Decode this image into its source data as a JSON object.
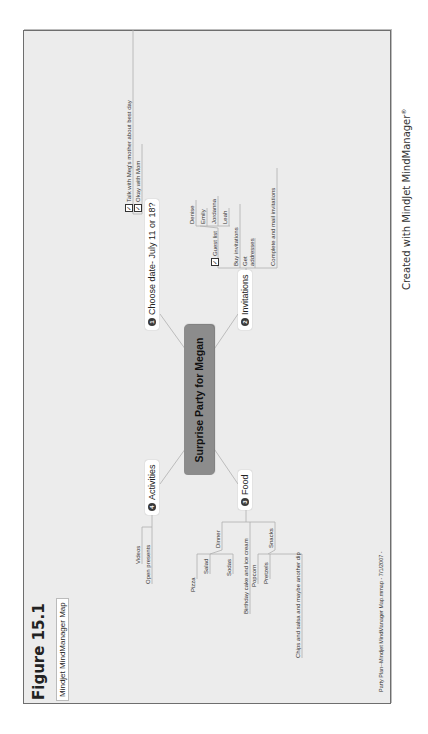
{
  "figure_title": "Figure 15.1",
  "map_label": "Mindjet MindManager Map",
  "central_topic": "Surprise Party for Megan",
  "branches": {
    "choose_date": {
      "number": "1",
      "label": "Choose date- July 11 or 18?",
      "children": [
        {
          "label": "Talk with Meg's mother about best day",
          "checked": true
        },
        {
          "label": "Okay with Mom",
          "checked": true
        }
      ]
    },
    "invitations": {
      "number": "2",
      "label": "Invitations",
      "children": [
        {
          "label": "Guest list",
          "checked": true,
          "children": [
            "Denise",
            "Emily",
            "Jordanna",
            "Leah"
          ]
        },
        {
          "label": "Buy invitations"
        },
        {
          "label": "Get addresses",
          "line1": "Get",
          "line2": "addresses"
        },
        {
          "label": "Complete and mail invitations"
        }
      ]
    },
    "food": {
      "number": "3",
      "label": "Food",
      "children": [
        {
          "label": "Dinner",
          "children": [
            "Pizza",
            "Salad",
            "Sodas"
          ]
        },
        {
          "label": "Birthday cake and ice cream"
        },
        {
          "label": "Snacks",
          "children": [
            "Popcorn",
            "Pretzels",
            "Chips and salsa and maybe another dip"
          ]
        }
      ]
    },
    "activities": {
      "number": "4",
      "label": "Activities",
      "children": [
        "Videos",
        "Open presents"
      ]
    }
  },
  "check_glyph": "✓",
  "credit": "Created with MindJet MindManager",
  "credit_mark": "®",
  "footer": "Party Plan--Mindjet MindManager Map.mmap - 7/1/2007 -"
}
